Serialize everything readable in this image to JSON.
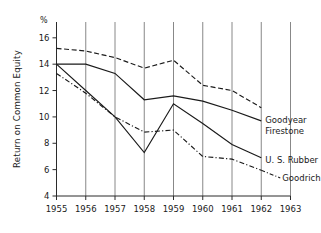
{
  "chart_data": {
    "type": "line",
    "title": "",
    "xlabel": "",
    "ylabel": "Return on Common Equity",
    "unit_marker": "%",
    "x": [
      1955,
      1956,
      1957,
      1958,
      1959,
      1960,
      1961,
      1962
    ],
    "xtick_labels": [
      "1955",
      "1956",
      "1957",
      "1958",
      "1959",
      "1960",
      "1961",
      "1962",
      "1963"
    ],
    "xlim": [
      1955,
      1963
    ],
    "ylim": [
      4,
      17.2
    ],
    "ytick_labels": [
      "4",
      "6",
      "8",
      "10",
      "12",
      "14",
      "16"
    ],
    "yticks": [
      4,
      6,
      8,
      10,
      12,
      14,
      16
    ],
    "grid": "vertical",
    "legend_position": "right-inline",
    "series": [
      {
        "name": "Goodyear",
        "style": "dashed",
        "label": "Goodyear",
        "values": [
          15.2,
          15.0,
          14.5,
          13.7,
          14.3,
          12.4,
          12.0,
          10.7
        ]
      },
      {
        "name": "Firestone",
        "style": "solid",
        "label": "Firestone",
        "values": [
          14.0,
          14.0,
          13.3,
          11.3,
          11.6,
          11.2,
          10.5,
          9.7
        ]
      },
      {
        "name": "U. S. Rubber",
        "style": "solid",
        "label": "U. S. Rubber",
        "values": [
          14.0,
          12.0,
          10.0,
          7.3,
          11.0,
          9.5,
          7.9,
          6.9
        ]
      },
      {
        "name": "Goodrich",
        "style": "dashdot",
        "label": "Goodrich",
        "values": [
          13.3,
          11.8,
          10.0,
          8.85,
          9.0,
          7.0,
          6.8,
          5.95
        ]
      }
    ],
    "colors": {
      "line": "#1a1a1a",
      "grid": "#7a7a7a",
      "axis": "#2b2b2b",
      "background": "#ffffff"
    }
  }
}
